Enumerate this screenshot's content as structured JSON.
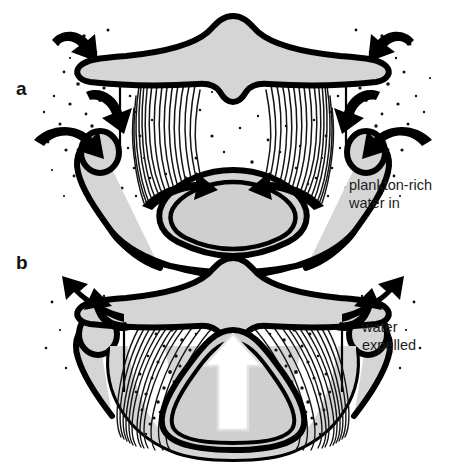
{
  "figure": {
    "background_color": "#ffffff",
    "width": 466,
    "height": 468
  },
  "style": {
    "ink": "#000000",
    "body_fill": "#d5d5d5",
    "tongue_fill": "#cfcfcf",
    "cavity_fill": "#ffffff",
    "outflow_arrow_fill": "#ffffff",
    "outflow_arrow_stroke": "#e2e2e2",
    "plankton_color": "#111111",
    "baleen_color": "#151515"
  },
  "panels": [
    {
      "id": "a",
      "label": "a",
      "caption": "plankton-rich\nwater in",
      "caption_line1": "plankton-rich",
      "caption_line2": "water in",
      "state": "mouth open",
      "mouth_open": true,
      "flow_direction": "inward",
      "arrow_color": "#000000",
      "arrow_count": 6,
      "plankton_location": "outside and entering mouth",
      "description": "Front view of a baleen whale head with the mouth open; curved black arrows on both sides show plankton-rich water flowing inward past the baleen plates."
    },
    {
      "id": "b",
      "label": "b",
      "caption": "water\nexpelled",
      "caption_line1": "water",
      "caption_line2": "expelled",
      "state": "mouth closed",
      "mouth_open": false,
      "flow_direction": "outward",
      "arrow_color": "#000000",
      "arrow_count": 4,
      "outflow_arrow": {
        "name": "tongue-push-arrow",
        "direction": "up",
        "fill": "#ffffff"
      },
      "plankton_location": "trapped in baleen fringe",
      "description": "Front view of the same head with the mouth closed; the tongue rises, water is expelled outward through the baleen while plankton stays trapped inside."
    }
  ],
  "anatomy": {
    "rostrum": "upper jaw",
    "baleen": "baleen plates",
    "mandible": "lower jaw",
    "tongue": "tongue"
  }
}
